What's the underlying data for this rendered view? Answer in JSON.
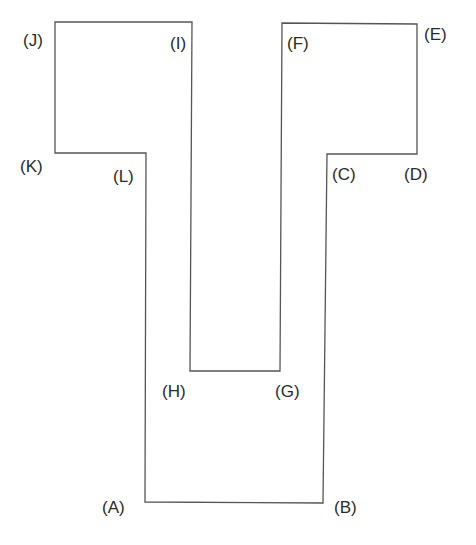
{
  "diagram": {
    "type": "polygon-outline",
    "stroke_color": "#555555",
    "background": "#ffffff",
    "vertices": [
      {
        "id": "A",
        "label": "(A)",
        "x": 145,
        "y": 502,
        "lx": 102,
        "ly": 513
      },
      {
        "id": "B",
        "label": "(B)",
        "x": 323,
        "y": 503,
        "lx": 334,
        "ly": 513
      },
      {
        "id": "C",
        "label": "(C)",
        "x": 327,
        "y": 154,
        "lx": 332,
        "ly": 180
      },
      {
        "id": "D",
        "label": "(D)",
        "x": 417,
        "y": 154,
        "lx": 404,
        "ly": 180
      },
      {
        "id": "E",
        "label": "(E)",
        "x": 417,
        "y": 24,
        "lx": 424,
        "ly": 40
      },
      {
        "id": "F",
        "label": "(F)",
        "x": 282,
        "y": 23,
        "lx": 287,
        "ly": 49
      },
      {
        "id": "G",
        "label": "(G)",
        "x": 280,
        "y": 371,
        "lx": 275,
        "ly": 397
      },
      {
        "id": "H",
        "label": "(H)",
        "x": 190,
        "y": 371,
        "lx": 162,
        "ly": 397
      },
      {
        "id": "I",
        "label": "(I)",
        "x": 192,
        "y": 22,
        "lx": 170,
        "ly": 49
      },
      {
        "id": "J",
        "label": "(J)",
        "x": 55,
        "y": 22,
        "lx": 23,
        "ly": 46
      },
      {
        "id": "K",
        "label": "(K)",
        "x": 55,
        "y": 153,
        "lx": 20,
        "ly": 172
      },
      {
        "id": "L",
        "label": "(L)",
        "x": 146,
        "y": 153,
        "lx": 113,
        "ly": 182
      }
    ]
  }
}
